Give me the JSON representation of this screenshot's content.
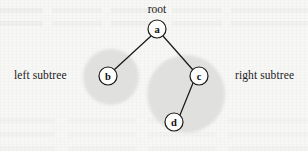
{
  "figure": {
    "name": "binary-tree-subtree-diagram",
    "width": 308,
    "height": 151,
    "background_color": "#f7f7f6"
  },
  "colors": {
    "background": "#f7f7f6",
    "halo_fill": "#e3e3e1",
    "node_fill": "#fdfdfd",
    "node_stroke": "#1a1a1a",
    "edge_stroke": "#1a1a1a",
    "text": "#1c1c1c"
  },
  "captions": {
    "root": "root",
    "left_subtree": "left subtree",
    "right_subtree": "right subtree"
  },
  "nodes": [
    {
      "id": "a",
      "label": "a",
      "cx": 157,
      "cy": 29,
      "r": 9
    },
    {
      "id": "b",
      "label": "b",
      "cx": 108,
      "cy": 76,
      "r": 9
    },
    {
      "id": "c",
      "label": "c",
      "cx": 199,
      "cy": 76,
      "r": 9
    },
    {
      "id": "d",
      "label": "d",
      "cx": 174,
      "cy": 122,
      "r": 9
    }
  ],
  "edges": [
    {
      "id": "a-b",
      "from": "a",
      "to": "b",
      "x1": 151,
      "y1": 36,
      "x2": 114,
      "y2": 70
    },
    {
      "id": "a-c",
      "from": "a",
      "to": "c",
      "x1": 163,
      "y1": 36,
      "x2": 193,
      "y2": 70
    },
    {
      "id": "c-d",
      "from": "c",
      "to": "d",
      "x1": 193,
      "y1": 83,
      "x2": 180,
      "y2": 115
    }
  ],
  "halos": [
    {
      "id": "left-subtree-halo",
      "cx": 111,
      "cy": 77,
      "r": 28
    },
    {
      "id": "right-subtree-halo",
      "cx": 186,
      "cy": 94,
      "r": 39
    }
  ],
  "label_positions": {
    "root": {
      "x": 157,
      "y": 13
    },
    "left_subtree": {
      "left": 14,
      "top": 69
    },
    "right_subtree": {
      "left": 235,
      "top": 69
    }
  }
}
